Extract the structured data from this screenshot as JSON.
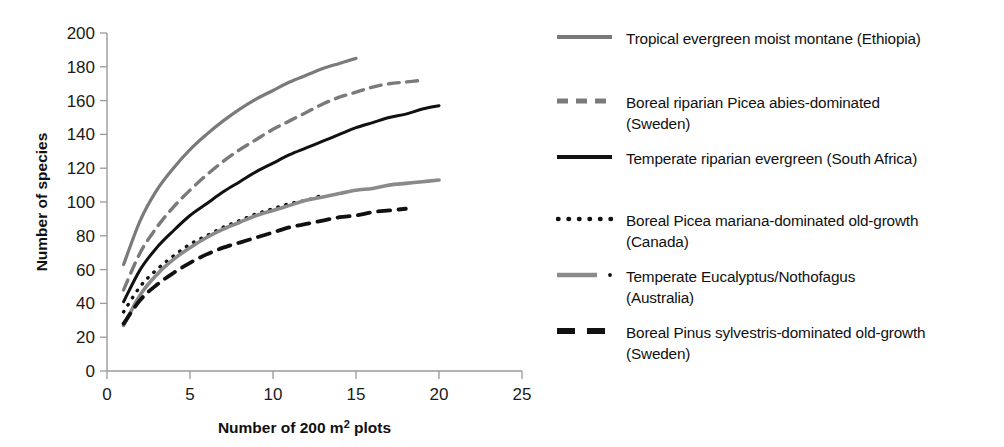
{
  "chart_data": {
    "type": "line",
    "title": "",
    "xlabel": "Number of 200 m² plots",
    "ylabel": "Number of species",
    "xlim": [
      0,
      25
    ],
    "ylim": [
      0,
      200
    ],
    "xticks": [
      0,
      5,
      10,
      15,
      20,
      25
    ],
    "yticks": [
      0,
      20,
      40,
      60,
      80,
      100,
      120,
      140,
      160,
      180,
      200
    ],
    "grid": false,
    "legend_position": "right",
    "series": [
      {
        "name": "Tropical evergreen moist montane (Ethiopia)",
        "style": "solid",
        "color": "#7a7a7a",
        "width": 3.2,
        "x": [
          1,
          2,
          3,
          4,
          5,
          6,
          7,
          8,
          9,
          10,
          11,
          12,
          13,
          14,
          15
        ],
        "values": [
          63,
          89,
          107,
          120,
          131,
          140,
          148,
          155,
          161,
          166,
          171,
          175,
          179,
          182,
          185
        ]
      },
      {
        "name": "Boreal riparian Picea abies-dominated (Sweden)",
        "style": "dashed",
        "color": "#7a7a7a",
        "width": 3.4,
        "x": [
          1,
          2,
          3,
          4,
          5,
          6,
          7,
          8,
          9,
          10,
          11,
          12,
          13,
          14,
          15,
          16,
          17,
          18,
          19
        ],
        "values": [
          48,
          70,
          85,
          97,
          107,
          116,
          124,
          131,
          137,
          143,
          148,
          153,
          158,
          162,
          165,
          168,
          170,
          171,
          172
        ]
      },
      {
        "name": "Temperate riparian evergreen (South Africa)",
        "style": "solid",
        "color": "#111111",
        "width": 3.0,
        "x": [
          1,
          2,
          3,
          4,
          5,
          6,
          7,
          8,
          9,
          10,
          11,
          12,
          13,
          14,
          15,
          16,
          17,
          18,
          19,
          20
        ],
        "values": [
          41,
          60,
          73,
          83,
          92,
          99,
          106,
          112,
          118,
          123,
          128,
          132,
          136,
          140,
          144,
          147,
          150,
          152,
          155,
          157
        ]
      },
      {
        "name": "Boreal Picea mariana-dominated old-growth (Canada)",
        "style": "dotted",
        "color": "#111111",
        "width": 3.4,
        "x": [
          1,
          2,
          3,
          4,
          5,
          6,
          7,
          8,
          9,
          10,
          11,
          12,
          13
        ],
        "values": [
          35,
          50,
          60,
          68,
          75,
          80,
          85,
          89,
          93,
          96,
          99,
          101,
          104
        ]
      },
      {
        "name": "Temperate Eucalyptus/Nothofagus (Australia)",
        "style": "solid",
        "color": "#8a8a8a",
        "width": 3.6,
        "x": [
          1,
          2,
          3,
          4,
          5,
          6,
          7,
          8,
          9,
          10,
          11,
          12,
          13,
          14,
          15,
          16,
          17,
          18,
          19,
          20
        ],
        "values": [
          27,
          45,
          57,
          66,
          73,
          79,
          84,
          88,
          92,
          95,
          98,
          101,
          103,
          105,
          107,
          108,
          110,
          111,
          112,
          113
        ]
      },
      {
        "name": "Boreal Pinus sylvestris-dominated old-growth (Sweden)",
        "style": "dashed",
        "color": "#111111",
        "width": 3.8,
        "x": [
          1,
          2,
          3,
          4,
          5,
          6,
          7,
          8,
          9,
          10,
          11,
          12,
          13,
          14,
          15,
          16,
          17,
          18
        ],
        "values": [
          28,
          42,
          51,
          58,
          64,
          69,
          73,
          76,
          79,
          82,
          85,
          87,
          89,
          91,
          92,
          94,
          95,
          96
        ]
      }
    ]
  },
  "legend": {
    "entries": [
      {
        "marker": "solid-gray-line-icon",
        "label": "Tropical evergreen moist montane (Ethiopia)"
      },
      {
        "marker": "dashed-gray-line-icon",
        "label": "Boreal riparian Picea abies-dominated\n(Sweden)"
      },
      {
        "marker": "solid-black-line-icon",
        "label": "Temperate riparian evergreen (South Africa)"
      },
      {
        "marker": "dotted-black-line-icon",
        "label": "Boreal Picea mariana-dominated old-growth\n(Canada)"
      },
      {
        "marker": "gray-line-dot-icon",
        "label": "Temperate Eucalyptus/Nothofagus\n(Australia)"
      },
      {
        "marker": "thick-dashed-black-line-icon",
        "label": "Boreal Pinus sylvestris-dominated old-growth\n(Sweden)"
      }
    ]
  },
  "colors": {
    "gray": "#7a7a7a",
    "black": "#111111",
    "axis": "#9a9a9a",
    "background": "#ffffff"
  }
}
